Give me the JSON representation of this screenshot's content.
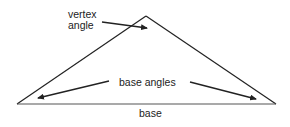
{
  "diagram": {
    "type": "isosceles-triangle",
    "stroke_color": "#222222",
    "labels": {
      "vertex_line1": "vertex",
      "vertex_line2": "angle",
      "base_angles": "base angles",
      "base": "base"
    },
    "vertices": {
      "left": [
        17,
        104
      ],
      "apex": [
        146,
        16
      ],
      "right": [
        276,
        104
      ]
    }
  }
}
